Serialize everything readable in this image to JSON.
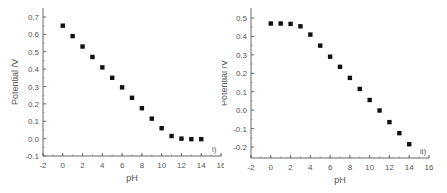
{
  "chart_data": [
    {
      "type": "scatter",
      "panel_label": "i)",
      "title": "",
      "xlabel": "pH",
      "ylabel": "Potential /V",
      "xlim": [
        -2,
        16
      ],
      "ylim": [
        -0.1,
        0.75
      ],
      "xticks": [
        -2,
        0,
        2,
        4,
        6,
        8,
        10,
        12,
        14,
        16
      ],
      "yticks": [
        -0.1,
        0.0,
        0.1,
        0.2,
        0.3,
        0.4,
        0.5,
        0.6,
        0.7
      ],
      "ytick_labels": [
        "-0.1",
        "0.0",
        "0.1",
        "0.2",
        "0.3",
        "0.4",
        "0.5",
        "0.6",
        "0.7"
      ],
      "grid": false,
      "legend": null,
      "series": [
        {
          "name": "i",
          "marker": "square",
          "color": "#111111",
          "x": [
            0,
            1,
            2,
            3,
            4,
            5,
            6,
            7,
            8,
            9,
            10,
            11,
            12,
            13,
            14
          ],
          "y": [
            0.65,
            0.59,
            0.53,
            0.47,
            0.41,
            0.35,
            0.295,
            0.235,
            0.175,
            0.115,
            0.06,
            0.015,
            0.0,
            -0.003,
            -0.003
          ]
        }
      ]
    },
    {
      "type": "scatter",
      "panel_label": "ii)",
      "title": "",
      "xlabel": "pH",
      "ylabel": "Potential /V",
      "xlim": [
        -2,
        16
      ],
      "ylim": [
        -0.25,
        0.55
      ],
      "xticks": [
        -2,
        0,
        2,
        4,
        6,
        8,
        10,
        12,
        14,
        16
      ],
      "yticks": [
        -0.2,
        -0.1,
        0.0,
        0.1,
        0.2,
        0.3,
        0.4,
        0.5
      ],
      "ytick_labels": [
        "-0.2",
        "-0.1",
        "0.0",
        "0.1",
        "0.2",
        "0.3",
        "0.4",
        "0.5"
      ],
      "grid": false,
      "legend": null,
      "series": [
        {
          "name": "ii",
          "marker": "square",
          "color": "#111111",
          "x": [
            0,
            1,
            2,
            3,
            4,
            5,
            6,
            7,
            8,
            9,
            10,
            11,
            12,
            13,
            14
          ],
          "y": [
            0.47,
            0.47,
            0.468,
            0.455,
            0.41,
            0.35,
            0.29,
            0.235,
            0.175,
            0.115,
            0.055,
            -0.002,
            -0.065,
            -0.125,
            -0.185
          ]
        }
      ]
    }
  ]
}
